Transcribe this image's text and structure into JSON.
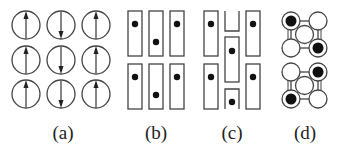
{
  "figure": {
    "panels": [
      {
        "id": "a",
        "label": "(a)",
        "description": "3x3 grid of circles with spin arrows: left column up, middle column down, right column up"
      },
      {
        "id": "b",
        "label": "(b)",
        "description": "2 rows x 3 columns of tall rectangles each containing a dot; middle column dots lower"
      },
      {
        "id": "c",
        "label": "(c)",
        "description": "staggered tall rectangles with dots; middle column shifted vertically"
      },
      {
        "id": "d",
        "label": "(d)",
        "description": "two stacked cube-like lattices of circles with filled (black) circles on diagonal corners"
      }
    ],
    "colors": {
      "stroke": "#333333",
      "fill_dot": "#111111",
      "background": "#ffffff"
    }
  }
}
